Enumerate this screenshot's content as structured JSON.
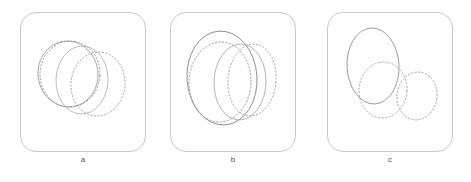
{
  "figure": {
    "background_color": "#ffffff",
    "panel_count": 3,
    "panel_frame_color": "#c9c9c9",
    "panel_fill_color": "#fefefe"
  },
  "panels": [
    {
      "id": "a",
      "label": "a",
      "frame": {
        "x": 20,
        "y": 12,
        "width": 126,
        "height": 140,
        "corner_radius": 16
      }
    },
    {
      "id": "b",
      "label": "b",
      "frame": {
        "x": 170,
        "y": 12,
        "width": 126,
        "height": 140,
        "corner_radius": 16
      }
    },
    {
      "id": "c",
      "label": "c",
      "frame": {
        "x": 327,
        "y": 12,
        "width": 126,
        "height": 140,
        "corner_radius": 16
      }
    }
  ],
  "chart_data": {
    "type": "scatter",
    "title": "",
    "xlabel": "",
    "ylabel": "",
    "grid": false,
    "legend": "none",
    "panels": [
      {
        "label": "a",
        "xlim": [
          0,
          126
        ],
        "ylim": [
          0,
          140
        ],
        "curves": [
          {
            "name": "ellipse-a1-solid",
            "style": "solid",
            "color": "#9a9a9a",
            "cx": 48,
            "cy": 62,
            "rx": 30,
            "ry": 33,
            "rotation": -8
          },
          {
            "name": "ellipse-a2-dotted",
            "style": "dotted",
            "color": "#8f8f8f",
            "cx": 50,
            "cy": 62,
            "rx": 30,
            "ry": 33,
            "rotation": 4
          },
          {
            "name": "ellipse-a3-dotted",
            "style": "dotted",
            "color": "#9a9a9a",
            "cx": 78,
            "cy": 72,
            "rx": 27,
            "ry": 32,
            "rotation": 6
          },
          {
            "name": "ellipse-a4-solid",
            "style": "solid",
            "color": "#b0b0b0",
            "cx": 62,
            "cy": 68,
            "rx": 26,
            "ry": 34,
            "rotation": 2
          }
        ]
      },
      {
        "label": "b",
        "xlim": [
          0,
          126
        ],
        "ylim": [
          0,
          140
        ],
        "curves": [
          {
            "name": "ellipse-b1-solid",
            "style": "solid",
            "color": "#7a7a7a",
            "cx": 52,
            "cy": 66,
            "rx": 35,
            "ry": 47,
            "rotation": -4
          },
          {
            "name": "ellipse-b2-dotted",
            "style": "dotted",
            "color": "#8f8f8f",
            "cx": 50,
            "cy": 70,
            "rx": 31,
            "ry": 40,
            "rotation": 3
          },
          {
            "name": "ellipse-b3-solid",
            "style": "solid",
            "color": "#a5a5a5",
            "cx": 70,
            "cy": 70,
            "rx": 26,
            "ry": 38,
            "rotation": 2
          },
          {
            "name": "ellipse-b4-dotted",
            "style": "dotted",
            "color": "#9a9a9a",
            "cx": 82,
            "cy": 68,
            "rx": 24,
            "ry": 36,
            "rotation": 5
          }
        ]
      },
      {
        "label": "c",
        "xlim": [
          0,
          126
        ],
        "ylim": [
          0,
          140
        ],
        "curves": [
          {
            "name": "ellipse-c1-solid",
            "style": "solid",
            "color": "#8a8a8a",
            "cx": 46,
            "cy": 54,
            "rx": 26,
            "ry": 38,
            "rotation": -3
          },
          {
            "name": "ellipse-c2-dotted",
            "style": "dotted",
            "color": "#9a9a9a",
            "cx": 56,
            "cy": 78,
            "rx": 24,
            "ry": 28,
            "rotation": 4
          },
          {
            "name": "ellipse-c3-dotted",
            "style": "dotted",
            "color": "#9a9a9a",
            "cx": 90,
            "cy": 84,
            "rx": 20,
            "ry": 24,
            "rotation": 8
          }
        ]
      }
    ]
  }
}
